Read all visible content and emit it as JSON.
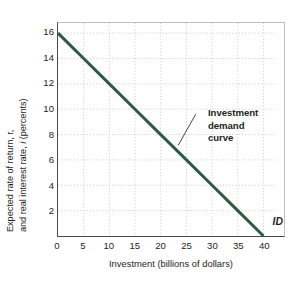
{
  "chart_data": {
    "type": "line",
    "title": "",
    "subtitle": "",
    "xlabel": "Investment (billions of dollars)",
    "ylabel_line1": "Expected rate of return, r,",
    "ylabel_line2_pre": "and real interest rate, ",
    "ylabel_line2_italic": "i",
    "ylabel_line2_post": " (percents)",
    "ylabel_full": "Expected rate of return, r, and real interest rate, i (percents)",
    "xlim": [
      0,
      44
    ],
    "ylim": [
      0,
      16.8
    ],
    "xticks": [
      0,
      5,
      10,
      15,
      20,
      25,
      30,
      35,
      40
    ],
    "yticks": [
      2,
      4,
      6,
      8,
      10,
      12,
      14,
      16
    ],
    "xtick_labels": [
      "0",
      "5",
      "10",
      "15",
      "20",
      "25",
      "30",
      "35",
      "40"
    ],
    "ytick_labels": [
      "2",
      "4",
      "6",
      "8",
      "10",
      "12",
      "14",
      "16"
    ],
    "grid": true,
    "grid_style": "dotted",
    "grid_color": "#c9c9c9",
    "legend": "none",
    "series": [
      {
        "name": "Investment demand curve",
        "label": "ID",
        "color": "#2b5c3f",
        "width": 3.0,
        "x": [
          0,
          5,
          10,
          15,
          20,
          25,
          30,
          35,
          40
        ],
        "y": [
          16,
          14,
          12,
          10,
          8,
          6,
          4,
          2,
          0
        ]
      }
    ],
    "annotations": [
      {
        "name": "investment-demand-curve-callout",
        "text_lines": [
          "Investment",
          "demand",
          "curve"
        ],
        "bold": true,
        "leader_from_x": 23.4,
        "leader_from_y": 7.15,
        "leader_to_x": 26.8,
        "leader_to_y": 9.6
      },
      {
        "name": "curve-id-label",
        "text": "ID",
        "bold": true,
        "italic": true,
        "x": 41.4,
        "y": 0.85
      }
    ]
  },
  "axes": {
    "x_title": "Investment (billions of dollars)",
    "y_title_line1": "Expected rate of return, r,",
    "y_title_line2_pre": "and real interest rate, ",
    "y_title_line2_italic": "i",
    "y_title_line2_post": " (percents)"
  },
  "colors": {
    "curve": "#2b5c3f",
    "grid": "#c9c9c9",
    "axis": "#4a4a4a",
    "frame_light": "#bfbfbf",
    "text": "#231f20",
    "background": "#ffffff"
  }
}
